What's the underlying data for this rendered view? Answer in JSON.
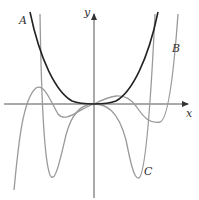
{
  "figure": {
    "axes": {
      "x_label": "x",
      "y_label": "y",
      "origin": [
        94,
        104
      ],
      "color": "#555555"
    },
    "curves": [
      {
        "name": "A",
        "label": "A",
        "color": "#222222",
        "description": "flat-bottomed even-power curve through origin"
      },
      {
        "name": "B",
        "label": "B",
        "color": "#9a9a9a",
        "description": "shallow W-shaped curve"
      },
      {
        "name": "C",
        "label": "C",
        "color": "#9a9a9a",
        "description": "deep W-shaped curve"
      }
    ]
  }
}
